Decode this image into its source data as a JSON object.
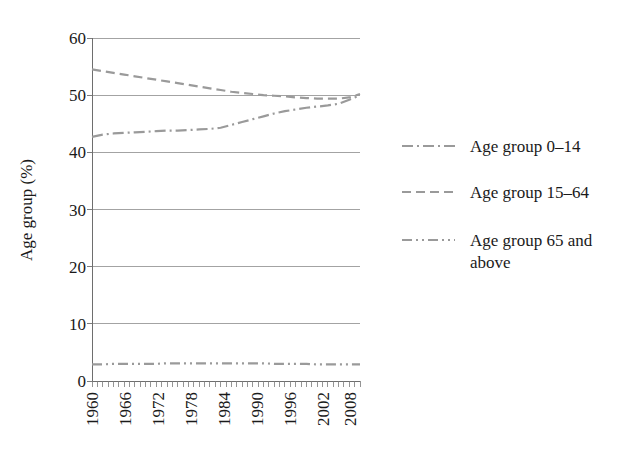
{
  "chart_data": {
    "type": "line",
    "title": "",
    "xlabel": "",
    "ylabel": "Age group (%)",
    "xlim": [
      1960,
      2010
    ],
    "ylim": [
      0,
      60
    ],
    "yticks": [
      0,
      10,
      20,
      30,
      40,
      50,
      60
    ],
    "ytick_labels": [
      "0",
      "10",
      "20",
      "30",
      "40",
      "50",
      "60"
    ],
    "xticks": [
      1960,
      1966,
      1972,
      1978,
      1984,
      1990,
      1996,
      2002,
      2008
    ],
    "xtick_labels": [
      "1960",
      "1966",
      "1972",
      "1978",
      "1984",
      "1990",
      "1996",
      "2002",
      "2008"
    ],
    "grid": "horizontal",
    "legend_position": "right",
    "x": [
      1960,
      1962,
      1964,
      1966,
      1968,
      1970,
      1972,
      1974,
      1976,
      1978,
      1980,
      1982,
      1984,
      1986,
      1988,
      1990,
      1992,
      1994,
      1996,
      1998,
      2000,
      2002,
      2004,
      2006,
      2008,
      2010
    ],
    "series": [
      {
        "name": "Age group 0–14",
        "linestyle": "dashdot",
        "color": "#9a9a9a",
        "values": [
          42.7,
          43.1,
          43.3,
          43.4,
          43.5,
          43.6,
          43.7,
          43.8,
          43.8,
          43.9,
          44.0,
          44.1,
          44.3,
          44.8,
          45.3,
          45.8,
          46.3,
          46.8,
          47.2,
          47.5,
          47.8,
          48.0,
          48.2,
          48.5,
          49.2,
          50.0
        ]
      },
      {
        "name": "Age group 15–64",
        "linestyle": "dashed",
        "color": "#9a9a9a",
        "values": [
          54.5,
          54.2,
          53.9,
          53.6,
          53.3,
          53.0,
          52.7,
          52.4,
          52.1,
          51.8,
          51.5,
          51.2,
          50.9,
          50.6,
          50.4,
          50.2,
          50.0,
          49.9,
          49.8,
          49.6,
          49.5,
          49.4,
          49.4,
          49.4,
          49.6,
          50.2
        ]
      },
      {
        "name": "Age group 65 and above",
        "name_line1": "Age group 65 and",
        "name_line2": "above",
        "linestyle": "dashdotdot",
        "color": "#9a9a9a",
        "values": [
          2.9,
          2.9,
          3.0,
          3.0,
          3.0,
          3.0,
          3.0,
          3.1,
          3.1,
          3.1,
          3.1,
          3.1,
          3.1,
          3.1,
          3.1,
          3.1,
          3.1,
          3.0,
          3.0,
          3.0,
          3.0,
          2.9,
          2.9,
          2.9,
          2.9,
          2.9
        ]
      }
    ]
  },
  "axes": {
    "y_title": "Age group (%)",
    "y_tick_0": "0",
    "y_tick_1": "10",
    "y_tick_2": "20",
    "y_tick_3": "30",
    "y_tick_4": "40",
    "y_tick_5": "50",
    "y_tick_6": "60",
    "x_tick_0": "1960",
    "x_tick_1": "1966",
    "x_tick_2": "1972",
    "x_tick_3": "1978",
    "x_tick_4": "1984",
    "x_tick_5": "1990",
    "x_tick_6": "1996",
    "x_tick_7": "2002",
    "x_tick_8": "2008"
  },
  "legend": {
    "entries": [
      {
        "label": "Age group 0–14",
        "line2": ""
      },
      {
        "label": "Age group 15–64",
        "line2": ""
      },
      {
        "label": "Age group 65 and",
        "line2": "above"
      }
    ]
  },
  "colors": {
    "line": "#9a9a9a",
    "grid": "#8c8c8c",
    "axis": "#6e6e6e",
    "text": "#1a1a1a",
    "background": "#ffffff"
  }
}
